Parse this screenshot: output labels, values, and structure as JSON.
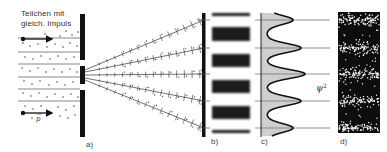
{
  "figure": {
    "caption_top_line1": "Teilchen mit",
    "caption_top_line2": "gleich. Impuls",
    "momentum_label": "p",
    "psi_label": "ψ",
    "psi_exponent": "2",
    "panels": {
      "a": "a)",
      "b": "b)",
      "c": "c)",
      "d": "d)"
    },
    "colors": {
      "ink": "#111111",
      "fill_gray": "#cfcfcf",
      "background": "#ffffff",
      "band_dark": "#1a1a1a"
    },
    "wave_peaks_y": [
      20,
      48,
      74,
      101,
      128
    ],
    "dark_bands_y": [
      [
        13,
        16
      ],
      [
        27,
        41
      ],
      [
        54,
        67
      ],
      [
        80,
        93
      ],
      [
        106,
        119
      ],
      [
        130,
        133
      ]
    ]
  }
}
